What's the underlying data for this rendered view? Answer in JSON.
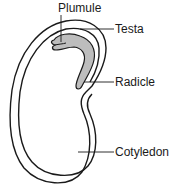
{
  "diagram": {
    "colors": {
      "outline": "#1a1a1a",
      "embryo_fill": "#bdbdbd",
      "background": "#ffffff"
    },
    "labels": [
      {
        "id": "plumule",
        "text": "Plumule"
      },
      {
        "id": "testa",
        "text": "Testa"
      },
      {
        "id": "radicle",
        "text": "Radicle"
      },
      {
        "id": "cotyledon",
        "text": "Cotyledon"
      }
    ]
  }
}
